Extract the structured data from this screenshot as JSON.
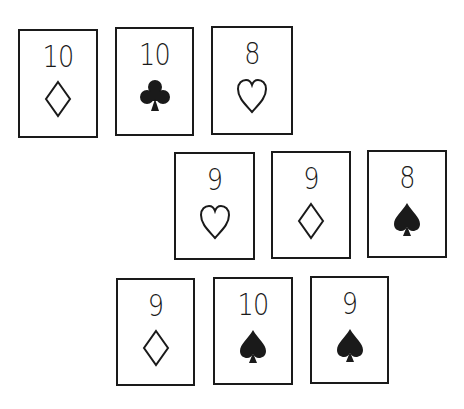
{
  "cards": [
    {
      "rank": "10",
      "suit": "diamond",
      "x": 18,
      "y": 29,
      "w": 80,
      "h": 109
    },
    {
      "rank": "10",
      "suit": "club",
      "x": 115,
      "y": 27,
      "w": 79,
      "h": 109
    },
    {
      "rank": "8",
      "suit": "heart",
      "x": 211,
      "y": 26,
      "w": 82,
      "h": 109
    },
    {
      "rank": "9",
      "suit": "heart",
      "x": 174,
      "y": 152,
      "w": 81,
      "h": 108
    },
    {
      "rank": "9",
      "suit": "diamond",
      "x": 271,
      "y": 151,
      "w": 80,
      "h": 108
    },
    {
      "rank": "8",
      "suit": "spade",
      "x": 367,
      "y": 150,
      "w": 80,
      "h": 108
    },
    {
      "rank": "9",
      "suit": "diamond",
      "x": 116,
      "y": 278,
      "w": 79,
      "h": 108
    },
    {
      "rank": "10",
      "suit": "spade",
      "x": 213,
      "y": 277,
      "w": 80,
      "h": 108
    },
    {
      "rank": "9",
      "suit": "spade",
      "x": 310,
      "y": 276,
      "w": 79,
      "h": 108
    }
  ],
  "colors": {
    "ink": "#1a1a1a",
    "background": "#ffffff"
  }
}
